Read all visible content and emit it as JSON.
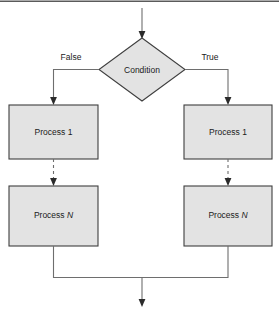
{
  "diagram": {
    "type": "flowchart",
    "colors": {
      "node_fill": "#e3e3e3",
      "node_stroke": "#3f3f3f",
      "connector": "#6e6e6e",
      "arrow": "#2b2b2b",
      "background": "#ffffff",
      "text": "#1a1a1a"
    },
    "nodes": {
      "decision": {
        "shape": "diamond",
        "label": "Condition"
      },
      "false_first": {
        "shape": "rectangle",
        "label_prefix": "Process",
        "label_suffix": "1"
      },
      "false_last": {
        "shape": "rectangle",
        "label_prefix": "Process",
        "label_suffix": "N"
      },
      "true_first": {
        "shape": "rectangle",
        "label_prefix": "Process",
        "label_suffix": "1"
      },
      "true_last": {
        "shape": "rectangle",
        "label_prefix": "Process",
        "label_suffix": "N"
      }
    },
    "edge_labels": {
      "false_branch": "False",
      "true_branch": "True"
    },
    "connectors": [
      {
        "name": "entry-arrow",
        "style": "solid",
        "arrow": true
      },
      {
        "name": "false-branch-elbow",
        "style": "solid",
        "arrow": true
      },
      {
        "name": "true-branch-elbow",
        "style": "solid",
        "arrow": true
      },
      {
        "name": "false-ellipsis-link",
        "style": "dashed",
        "arrow": true
      },
      {
        "name": "true-ellipsis-link",
        "style": "dashed",
        "arrow": true
      },
      {
        "name": "false-merge-elbow",
        "style": "solid",
        "arrow": false
      },
      {
        "name": "true-merge-elbow",
        "style": "solid",
        "arrow": false
      },
      {
        "name": "exit-arrow",
        "style": "solid",
        "arrow": true
      }
    ]
  }
}
